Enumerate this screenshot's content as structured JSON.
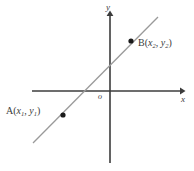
{
  "figure": {
    "type": "coordinate-plane-line-diagram",
    "background_color": "#ffffff",
    "axis_color": "#3c3c3c",
    "line_color": "#9a9a9a",
    "point_color": "#1a1a1a",
    "label_color": "#3a3a3a"
  },
  "axes": {
    "x_label": "x",
    "y_label": "y",
    "origin_label": "o",
    "x_axis": {
      "x1": 32,
      "y1": 91,
      "x2": 182,
      "y2": 91,
      "arrow": "right"
    },
    "y_axis": {
      "x1": 110,
      "y1": 12,
      "x2": 110,
      "y2": 163,
      "arrow": "up"
    }
  },
  "line": {
    "name": "line-AB",
    "x1": 33,
    "y1": 143,
    "x2": 158,
    "y2": 17,
    "x_intercept_px": 88,
    "y_intercept_px": 66
  },
  "points": [
    {
      "id": "A",
      "name": "A",
      "label_prefix": "A(",
      "x_var": "x",
      "x_sub": "1",
      "separator": ", ",
      "y_var": "y",
      "y_sub": "1",
      "label_suffix": ")",
      "label_full": "A(x1, y1)",
      "cx": 63,
      "cy": 115,
      "r": 2.6
    },
    {
      "id": "B",
      "name": "B",
      "label_prefix": "B(",
      "x_var": "x",
      "x_sub": "2",
      "separator": ", ",
      "y_var": "y",
      "y_sub": "2",
      "label_suffix": ")",
      "label_full": "B(x2, y2)",
      "cx": 131,
      "cy": 41,
      "r": 2.6
    }
  ]
}
